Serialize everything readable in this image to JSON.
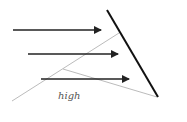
{
  "diagram": {
    "label": "high",
    "colors": {
      "arrows": "#222222",
      "surface": "#111111",
      "thin_lines": "#aaaaaa",
      "label": "#555555"
    },
    "surface_line": {
      "x1": 107,
      "y1": 10,
      "x2": 158,
      "y2": 97
    },
    "arrows": [
      {
        "x1": 13,
        "y1": 30,
        "x2": 101,
        "y2": 30
      },
      {
        "x1": 28,
        "y1": 54,
        "x2": 118,
        "y2": 54
      },
      {
        "x1": 41,
        "y1": 79,
        "x2": 129,
        "y2": 79
      }
    ],
    "thin_lines": [
      {
        "x1": 12,
        "y1": 101,
        "x2": 119,
        "y2": 33
      },
      {
        "x1": 63,
        "y1": 69,
        "x2": 157,
        "y2": 97
      }
    ]
  }
}
